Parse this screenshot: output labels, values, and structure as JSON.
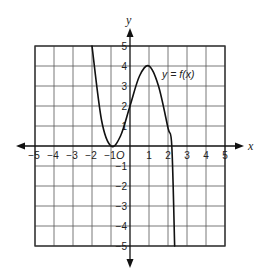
{
  "chart_data": {
    "type": "line",
    "title": "",
    "xlabel": "x",
    "ylabel": "y",
    "xlim": [
      -5,
      5
    ],
    "ylim": [
      -5,
      5
    ],
    "grid": true,
    "x_ticks": [
      "-5",
      "-4",
      "-3",
      "-2",
      "-1",
      "1",
      "2",
      "3",
      "4",
      "5"
    ],
    "y_ticks": [
      "5",
      "4",
      "3",
      "2",
      "1",
      "-1",
      "-2",
      "-3",
      "-4",
      "-5"
    ],
    "origin_label": "O",
    "series": [
      {
        "name": "y = f(x)",
        "x": [
          -2.0,
          -1.5,
          -1.0,
          -0.5,
          0.0,
          0.5,
          1.0,
          1.5,
          2.0,
          2.2,
          2.35
        ],
        "y": [
          5.0,
          1.3,
          0.0,
          0.5,
          2.0,
          3.5,
          4.0,
          3.0,
          0.9,
          0.0,
          -5.0
        ]
      }
    ],
    "annotations": [
      {
        "text": "y = f(x)",
        "x": 1.5,
        "y": 3.7
      }
    ],
    "key_points": {
      "local_min": [
        -1,
        0
      ],
      "local_max": [
        1,
        4
      ],
      "y_intercept": [
        0,
        2
      ],
      "x_intercepts": [
        -1,
        2.2
      ]
    }
  },
  "labels": {
    "x_axis": "x",
    "y_axis": "y",
    "origin": "O",
    "function": "y = f(x)"
  }
}
